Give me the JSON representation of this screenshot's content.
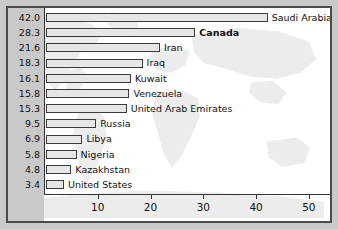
{
  "chart_data": {
    "type": "bar",
    "orientation": "horizontal",
    "title": "",
    "subtitle": "",
    "xlabel": "",
    "ylabel": "",
    "xlim": [
      0,
      54
    ],
    "grid": false,
    "legend": null,
    "xticks": [
      10,
      20,
      30,
      40,
      50
    ],
    "xtick_labels": [
      "10",
      "20",
      "30",
      "40",
      "50"
    ],
    "categories": [
      "Saudi Arabia",
      "Canada",
      "Iran",
      "Iraq",
      "Kuwait",
      "Venezuela",
      "United Arab Emirates",
      "Russia",
      "Libya",
      "Nigeria",
      "Kazakhstan",
      "United States"
    ],
    "values": [
      42.0,
      28.3,
      21.6,
      18.3,
      16.1,
      15.8,
      15.3,
      9.5,
      6.9,
      5.8,
      4.8,
      3.4
    ],
    "value_labels": [
      "42.0",
      "28.3",
      "21.6",
      "18.3",
      "16.1",
      "15.8",
      "15.3",
      "9.5",
      "6.9",
      "5.8",
      "4.8",
      "3.4"
    ],
    "highlighted_category": "Canada",
    "rows": [
      {
        "value_label": "42.0",
        "value": 42.0,
        "label": "Saudi Arabia",
        "highlight": false
      },
      {
        "value_label": "28.3",
        "value": 28.3,
        "label": "Canada",
        "highlight": true
      },
      {
        "value_label": "21.6",
        "value": 21.6,
        "label": "Iran",
        "highlight": false
      },
      {
        "value_label": "18.3",
        "value": 18.3,
        "label": "Iraq",
        "highlight": false
      },
      {
        "value_label": "16.1",
        "value": 16.1,
        "label": "Kuwait",
        "highlight": false
      },
      {
        "value_label": "15.8",
        "value": 15.8,
        "label": "Venezuela",
        "highlight": false
      },
      {
        "value_label": "15.3",
        "value": 15.3,
        "label": "United Arab Emirates",
        "highlight": false
      },
      {
        "value_label": "9.5",
        "value": 9.5,
        "label": "Russia",
        "highlight": false
      },
      {
        "value_label": "6.9",
        "value": 6.9,
        "label": "Libya",
        "highlight": false
      },
      {
        "value_label": "5.8",
        "value": 5.8,
        "label": "Nigeria",
        "highlight": false
      },
      {
        "value_label": "4.8",
        "value": 4.8,
        "label": "Kazakhstan",
        "highlight": false
      },
      {
        "value_label": "3.4",
        "value": 3.4,
        "label": "United States",
        "highlight": false
      }
    ]
  },
  "colors": {
    "background": "#c9c9c9",
    "plot_background": "#ffffff",
    "bar_fill": "#e6e6e6",
    "bar_border": "#3b3b3b",
    "axis": "#333333",
    "text": "#111111",
    "map_watermark": "#ececec"
  }
}
